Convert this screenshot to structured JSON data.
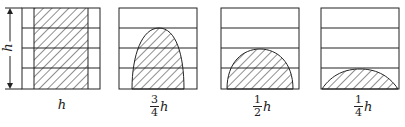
{
  "diagram": {
    "side_dimension_label": "h",
    "panels": [
      {
        "id": 1,
        "shape": "rectangle",
        "fill_height": "h",
        "label": {
          "text": "h",
          "numerator": "",
          "denominator": "",
          "variable": "h"
        }
      },
      {
        "id": 2,
        "shape": "tall-arch",
        "fill_height": "3/4 h",
        "label": {
          "numerator": "3",
          "denominator": "4",
          "variable": "h"
        }
      },
      {
        "id": 3,
        "shape": "semicircle",
        "fill_height": "1/2 h",
        "label": {
          "numerator": "1",
          "denominator": "2",
          "variable": "h"
        }
      },
      {
        "id": 4,
        "shape": "low-arch",
        "fill_height": "1/4 h",
        "label": {
          "numerator": "1",
          "denominator": "4",
          "variable": "h"
        }
      }
    ],
    "colors": {
      "stroke": "#222222",
      "background": "#ffffff"
    }
  }
}
